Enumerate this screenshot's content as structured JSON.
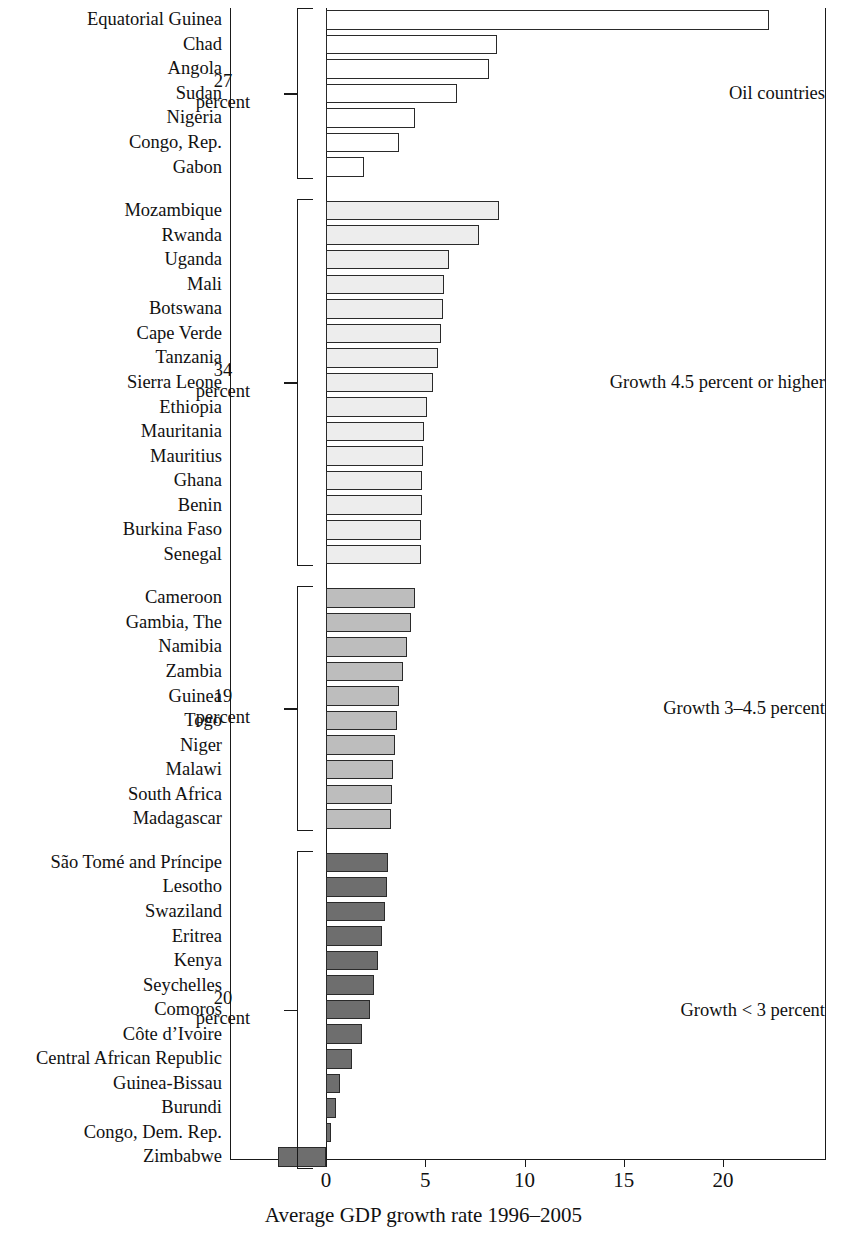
{
  "chart_data": {
    "type": "bar",
    "orientation": "horizontal",
    "title": "",
    "xlabel": "Average GDP growth rate 1996–2005",
    "ylabel": "",
    "xlim": [
      -3.2,
      25.2
    ],
    "xticks": [
      0,
      5,
      10,
      15,
      20
    ],
    "xtick_labels": [
      "0",
      "5",
      "10",
      "15",
      "20"
    ],
    "grid": false,
    "legend": "none",
    "groups": [
      {
        "id": "oil",
        "caption": "Oil countries",
        "share_value": "27",
        "share_unit": "percent",
        "fill": "#ffffff",
        "categories": [
          "Equatorial Guinea",
          "Chad",
          "Angola",
          "Sudan",
          "Nigeria",
          "Congo, Rep.",
          "Gabon"
        ],
        "values": [
          22.3,
          8.6,
          8.2,
          6.6,
          4.5,
          3.7,
          1.9
        ]
      },
      {
        "id": "growth-high",
        "caption": "Growth 4.5 percent or higher",
        "share_value": "34",
        "share_unit": "percent",
        "fill": "#ededed",
        "categories": [
          "Mozambique",
          "Rwanda",
          "Uganda",
          "Mali",
          "Botswana",
          "Cape Verde",
          "Tanzania",
          "Sierra Leone",
          "Ethiopia",
          "Mauritania",
          "Mauritius",
          "Ghana",
          "Benin",
          "Burkina Faso",
          "Senegal"
        ],
        "values": [
          8.7,
          7.7,
          6.2,
          5.95,
          5.9,
          5.8,
          5.65,
          5.4,
          5.1,
          4.95,
          4.9,
          4.85,
          4.82,
          4.8,
          4.8
        ]
      },
      {
        "id": "growth-mid",
        "caption": "Growth 3–4.5 percent",
        "share_value": "19",
        "share_unit": "percent",
        "fill": "#bdbdbd",
        "categories": [
          "Cameroon",
          "Gambia, The",
          "Namibia",
          "Zambia",
          "Guinea",
          "Togo",
          "Niger",
          "Malawi",
          "South Africa",
          "Madagascar"
        ],
        "values": [
          4.5,
          4.3,
          4.1,
          3.9,
          3.7,
          3.6,
          3.5,
          3.4,
          3.33,
          3.28
        ]
      },
      {
        "id": "growth-low",
        "caption": "Growth < 3 percent",
        "share_value": "20",
        "share_unit": "percent",
        "fill": "#6e6e6e",
        "categories": [
          "São Tomé and Príncipe",
          "Lesotho",
          "Swaziland",
          "Eritrea",
          "Kenya",
          "Seychelles",
          "Comoros",
          "Côte d’Ivoire",
          "Central African Republic",
          "Guinea-Bissau",
          "Burundi",
          "Congo, Dem. Rep.",
          "Zimbabwe"
        ],
        "values": [
          3.1,
          3.05,
          2.95,
          2.8,
          2.6,
          2.4,
          2.2,
          1.8,
          1.3,
          0.7,
          0.5,
          0.25,
          -2.4
        ]
      }
    ]
  }
}
